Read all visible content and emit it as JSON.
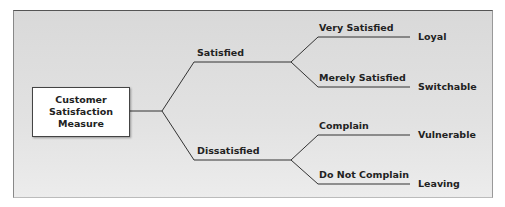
{
  "diagram": {
    "root": {
      "line1": "Customer",
      "line2": "Satisfaction",
      "line3": "Measure"
    },
    "level1": [
      {
        "label": "Satisfied"
      },
      {
        "label": "Dissatisfied"
      }
    ],
    "level2": [
      {
        "label": "Very Satisfied",
        "outcome": "Loyal"
      },
      {
        "label": "Merely Satisfied",
        "outcome": "Switchable"
      },
      {
        "label": "Complain",
        "outcome": "Vulnerable"
      },
      {
        "label": "Do Not Complain",
        "outcome": "Leaving"
      }
    ],
    "colors": {
      "panel": "#e0e0e0",
      "line": "#333333",
      "box": "#ffffff",
      "text": "#222222"
    }
  }
}
